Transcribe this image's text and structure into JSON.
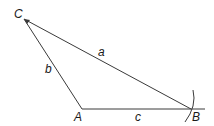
{
  "diagram": {
    "type": "triangle-construction",
    "stroke_color": "#3a3a3a",
    "vertices": {
      "A": {
        "label": "A",
        "x": 82,
        "y": 109
      },
      "B": {
        "label": "B",
        "x": 191,
        "y": 109
      },
      "C": {
        "label": "C",
        "x": 24,
        "y": 19
      }
    },
    "sides": {
      "a": {
        "label": "a",
        "from": "C",
        "to": "B"
      },
      "b": {
        "label": "b",
        "from": "C",
        "to": "A"
      },
      "c": {
        "label": "c",
        "from": "A",
        "to": "B"
      }
    },
    "construction": {
      "ray_end_x": 205,
      "arc_center": "C",
      "arc_description": "compass arc through B"
    }
  }
}
